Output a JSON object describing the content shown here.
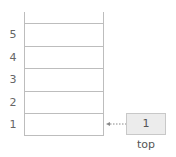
{
  "diagram": {
    "type": "stack",
    "slots": [
      {
        "index": "5",
        "value": ""
      },
      {
        "index": "4",
        "value": ""
      },
      {
        "index": "3",
        "value": ""
      },
      {
        "index": "2",
        "value": ""
      },
      {
        "index": "1",
        "value": ""
      }
    ],
    "pointer": {
      "value": "1",
      "label": "top",
      "points_to_index": "1"
    }
  },
  "colors": {
    "line": "#bdbdbd",
    "box_fill": "#ececec",
    "text": "#555555"
  }
}
